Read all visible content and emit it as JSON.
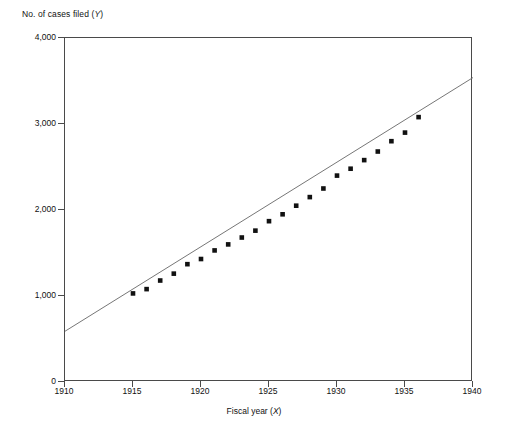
{
  "chart_data": {
    "type": "scatter",
    "title": "",
    "xlabel": "Fiscal year (X)",
    "ylabel": "No. of cases filed (Y)",
    "xlabel_text": "Fiscal year (",
    "xlabel_var": "X",
    "ylabel_text": "No. of cases filed (",
    "ylabel_var": "Y",
    "xlim": [
      1910,
      1940
    ],
    "ylim": [
      0,
      4000
    ],
    "xticks": [
      1910,
      1915,
      1920,
      1925,
      1930,
      1935,
      1940
    ],
    "xtick_labels": [
      "1910",
      "1915",
      "1920",
      "1925",
      "1930",
      "1935",
      "1940"
    ],
    "yticks": [
      0,
      1000,
      2000,
      3000,
      4000
    ],
    "ytick_labels": [
      "0",
      "1,000",
      "2,000",
      "3,000",
      "4,000"
    ],
    "grid": false,
    "legend": false,
    "marker": "square",
    "marker_color": "#111111",
    "line_color": "#666666",
    "x": [
      1915,
      1916,
      1917,
      1918,
      1919,
      1920,
      1921,
      1922,
      1923,
      1924,
      1925,
      1926,
      1927,
      1928,
      1929,
      1930,
      1931,
      1932,
      1933,
      1934,
      1935,
      1936
    ],
    "values": [
      1030,
      1080,
      1180,
      1260,
      1370,
      1430,
      1530,
      1600,
      1680,
      1760,
      1870,
      1950,
      2050,
      2150,
      2250,
      2400,
      2480,
      2580,
      2680,
      2800,
      2900,
      3080
    ],
    "fit_line": {
      "x": [
        1910,
        1940
      ],
      "y": [
        590,
        3540
      ],
      "description": "fitted straight trend line spanning full x-axis"
    }
  }
}
